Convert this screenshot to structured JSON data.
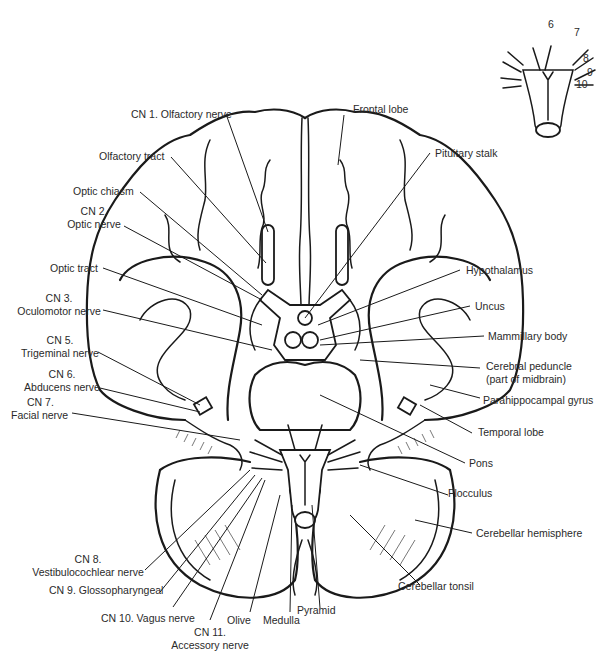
{
  "figure": {
    "left_labels": [
      {
        "id": "cn1",
        "text": "CN 1. Olfactory nerve"
      },
      {
        "id": "olfactory_tract",
        "text": "Olfactory tract"
      },
      {
        "id": "optic_chiasm",
        "text": "Optic chiasm"
      },
      {
        "id": "cn2",
        "line1": "CN 2.",
        "line2": "Optic nerve"
      },
      {
        "id": "optic_tract",
        "text": "Optic tract"
      },
      {
        "id": "cn3",
        "line1": "CN 3.",
        "line2": "Oculomotor nerve"
      },
      {
        "id": "cn5",
        "line1": "CN 5.",
        "line2": "Trigeminal nerve"
      },
      {
        "id": "cn6",
        "line1": "CN 6.",
        "line2": "Abducens nerve"
      },
      {
        "id": "cn7",
        "line1": "CN 7.",
        "line2": "Facial nerve"
      }
    ],
    "right_labels": [
      {
        "id": "frontal_lobe",
        "text": "Frontal lobe"
      },
      {
        "id": "pituitary_stalk",
        "text": "Pituitary stalk"
      },
      {
        "id": "hypothalamus",
        "text": "Hypothalamus"
      },
      {
        "id": "uncus",
        "text": "Uncus"
      },
      {
        "id": "mammillary_body",
        "text": "Mammillary body"
      },
      {
        "id": "cerebral_peduncle",
        "line1": "Cerebral peduncle",
        "line2": "(part of midbrain)"
      },
      {
        "id": "parahippocampal_gyrus",
        "text": "Parahippocampal gyrus"
      },
      {
        "id": "temporal_lobe",
        "text": "Temporal lobe"
      },
      {
        "id": "pons",
        "text": "Pons"
      },
      {
        "id": "flocculus",
        "text": "Flocculus"
      },
      {
        "id": "cerebellar_hemisphere",
        "text": "Cerebellar hemisphere"
      },
      {
        "id": "cerebellar_tonsil",
        "text": "Cerebellar tonsil"
      }
    ],
    "bottom_labels": [
      {
        "id": "cn8",
        "line1": "CN 8.",
        "line2": "Vestibulocochlear nerve"
      },
      {
        "id": "cn9",
        "text": "CN 9. Glossopharyngeal"
      },
      {
        "id": "cn10",
        "text": "CN 10. Vagus nerve"
      },
      {
        "id": "cn11",
        "line1": "CN 11.",
        "line2": "Accessory nerve"
      },
      {
        "id": "olive",
        "text": "Olive"
      },
      {
        "id": "medulla",
        "text": "Medulla"
      },
      {
        "id": "pyramid",
        "text": "Pyramid"
      }
    ],
    "inset": {
      "description": "Brainstem inset with numbered cranial nerves",
      "numbers": [
        "6",
        "7",
        "8",
        "9",
        "10"
      ]
    }
  }
}
